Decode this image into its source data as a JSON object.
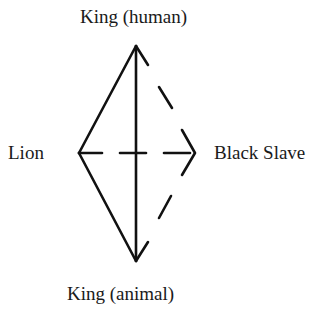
{
  "diagram": {
    "nodes": {
      "top": "King (human)",
      "bottom": "King (animal)",
      "left": "Lion",
      "right": "Black Slave"
    },
    "colors": {
      "stroke": "#111111",
      "text": "#1a1a1a",
      "background": "#ffffff"
    },
    "edges": [
      {
        "from": "Lion",
        "to": "King (human)",
        "style": "solid"
      },
      {
        "from": "Lion",
        "to": "King (animal)",
        "style": "solid"
      },
      {
        "from": "King (animal)",
        "to": "King (human)",
        "style": "solid",
        "arrows": "both"
      },
      {
        "from": "Lion",
        "to": "Black Slave",
        "style": "dashed"
      },
      {
        "from": "King (human)",
        "to": "Black Slave",
        "style": "dashed"
      },
      {
        "from": "Black Slave",
        "to": "King (animal)",
        "style": "dashed"
      }
    ]
  }
}
